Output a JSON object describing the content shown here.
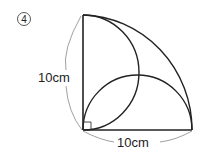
{
  "problem_number": "4",
  "labels": {
    "vertical_side": "10cm",
    "horizontal_side": "10cm"
  },
  "shapes": {
    "quarter_circle": "radius 10cm centered at right-angle corner",
    "semicircle_vertical": "diameter on vertical side",
    "semicircle_horizontal": "diameter on horizontal side",
    "right_angle_mark": true
  },
  "colors": {
    "stroke": "#222222",
    "dimension": "#777777"
  }
}
